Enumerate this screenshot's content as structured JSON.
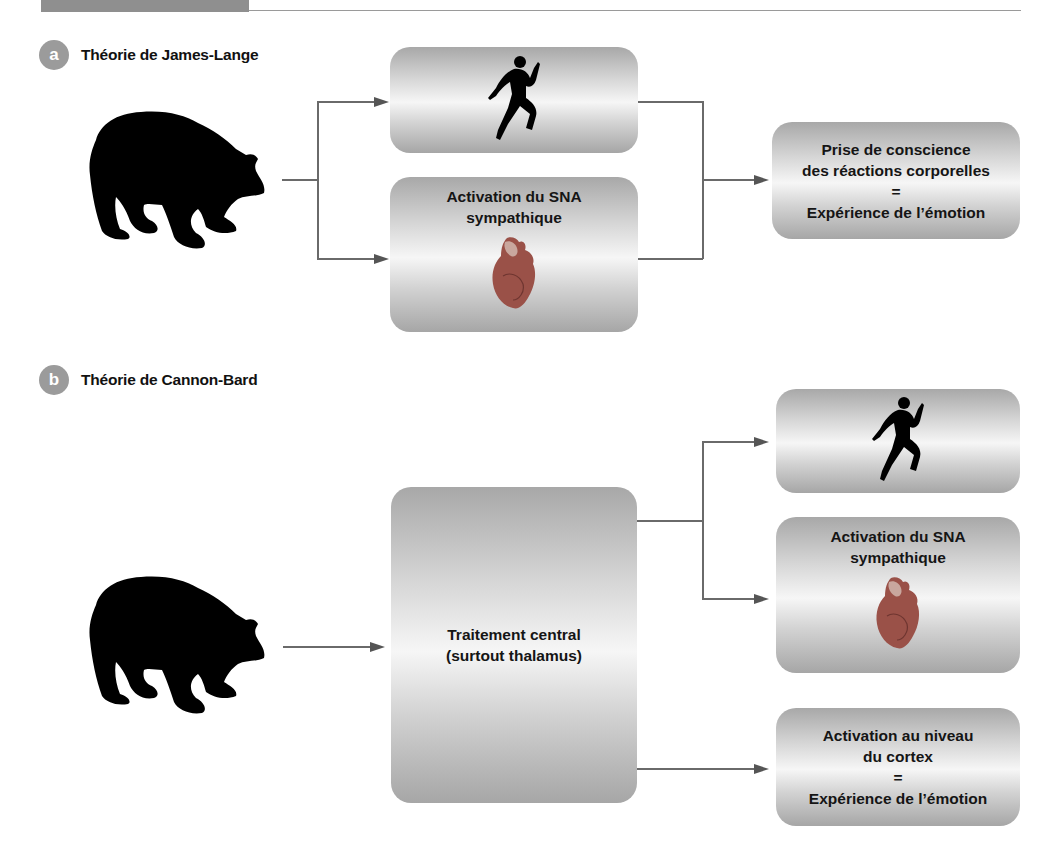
{
  "header": {
    "accent_bar_color": "#8f8f8f",
    "rule_color": "#9a9a9a"
  },
  "sections": [
    {
      "badge": "a",
      "title": "Théorie de James-Lange",
      "stimulus_icon": "bear-silhouette-icon",
      "boxes": [
        {
          "id": "behavior",
          "icon": "running-person-icon",
          "text": ""
        },
        {
          "id": "sna",
          "text": "Activation du SNA\nsympathique",
          "icon": "heart-icon"
        },
        {
          "id": "result",
          "text": "Prise de conscience\ndes réactions corporelles\n=\nExpérience de l’émotion"
        }
      ]
    },
    {
      "badge": "b",
      "title": "Théorie de Cannon-Bard",
      "stimulus_icon": "bear-silhouette-icon",
      "boxes": [
        {
          "id": "central",
          "text": "Traitement central\n(surtout thalamus)"
        },
        {
          "id": "behavior",
          "icon": "running-person-icon",
          "text": ""
        },
        {
          "id": "sna",
          "text": "Activation du SNA\nsympathique",
          "icon": "heart-icon"
        },
        {
          "id": "cortex",
          "text": "Activation au niveau\ndu cortex\n=\nExpérience de l’émotion"
        }
      ]
    }
  ],
  "colors": {
    "badge": "#9b9b9b",
    "connector": "#6a6a6a",
    "box_dark": "#a8a8a8",
    "box_light": "#f6f6f6",
    "heart": "#a0524a"
  }
}
